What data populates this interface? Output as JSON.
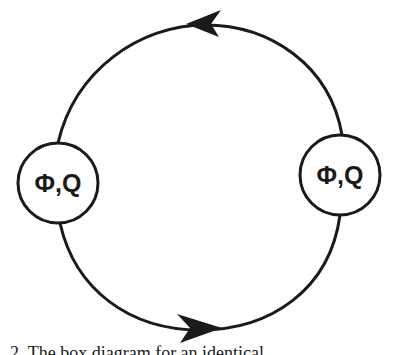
{
  "diagram": {
    "type": "loop-diagram",
    "colors": {
      "stroke": "#1a1a1a",
      "background": "#ffffff"
    },
    "nodes": [
      {
        "id": "left",
        "label": "Φ,Q"
      },
      {
        "id": "right",
        "label": "Φ,Q"
      }
    ],
    "edges": [
      {
        "from": "right",
        "to": "left",
        "path": "upper-arc",
        "arrow_direction": "left"
      },
      {
        "from": "left",
        "to": "right",
        "path": "lower-arc",
        "arrow_direction": "right"
      }
    ]
  },
  "caption": {
    "text": "2.  The box diagram for an identical ..."
  }
}
